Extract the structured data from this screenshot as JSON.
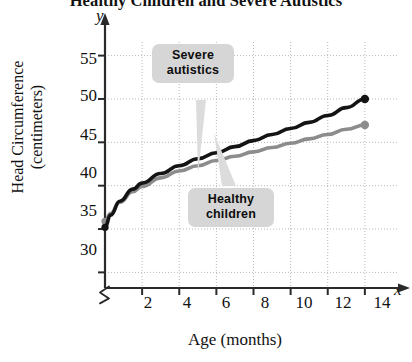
{
  "chart_data": {
    "type": "line",
    "title": "Healthy Children and Severe Autistics",
    "xlabel": "Age (months)",
    "ylabel": "Head Circumference (centimeters)",
    "x_axis_letter": "x",
    "y_axis_letter": "y",
    "xlim": [
      0,
      15.3
    ],
    "ylim": [
      28.2,
      56.8
    ],
    "x_ticks": [
      2,
      4,
      6,
      8,
      10,
      12,
      14
    ],
    "y_ticks": [
      30,
      35,
      40,
      45,
      50,
      55
    ],
    "x_tick_labels": [
      "2",
      "4",
      "6",
      "8",
      "10",
      "12",
      "14"
    ],
    "y_tick_labels": [
      "30",
      "35",
      "40",
      "45",
      "50",
      "55"
    ],
    "grid": true,
    "grid_style": "dotted",
    "y_axis_break": true,
    "legend": "none",
    "annotations": [
      {
        "name": "severe-autistics",
        "lines": [
          "Severe",
          "autistics"
        ],
        "points_to_series": "Severe autistics"
      },
      {
        "name": "healthy-children",
        "lines": [
          "Healthy",
          "children"
        ],
        "points_to_series": "Healthy children"
      }
    ],
    "series": [
      {
        "name": "Severe autistics",
        "color": "#141414",
        "marker": "circle",
        "x": [
          0,
          0.3,
          0.8,
          1.5,
          2,
          3,
          4,
          5,
          6,
          7,
          8,
          9,
          10,
          11,
          12,
          13,
          14
        ],
        "values": [
          35.2,
          36.6,
          38.2,
          39.6,
          40.3,
          41.4,
          42.3,
          43.1,
          43.8,
          44.5,
          45.2,
          45.9,
          46.6,
          47.3,
          48.1,
          49.0,
          50.0
        ]
      },
      {
        "name": "Healthy children",
        "color": "#8c8c8c",
        "marker": "circle",
        "x": [
          0,
          0.3,
          0.8,
          1.5,
          2,
          3,
          4,
          5,
          6,
          7,
          8,
          9,
          10,
          11,
          12,
          13,
          14
        ],
        "values": [
          35.9,
          36.8,
          38.1,
          39.3,
          39.9,
          40.9,
          41.7,
          42.3,
          42.9,
          43.4,
          43.9,
          44.4,
          44.9,
          45.4,
          45.9,
          46.5,
          47.0
        ]
      }
    ]
  },
  "colors": {
    "severe_line": "#141414",
    "healthy_line": "#8c8c8c",
    "axis": "#2a2a2a",
    "grid": "#b9b9b9",
    "callout_bg": "#d6d6d6",
    "text": "#111111"
  }
}
